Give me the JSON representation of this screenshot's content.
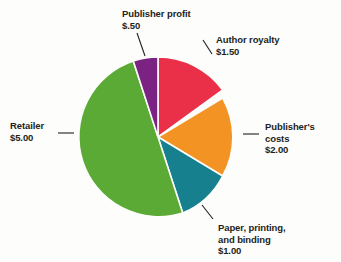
{
  "background_color": "#fdfdfb",
  "text_color": "#231f20",
  "leader_color": "#231f20",
  "chart_data": {
    "type": "pie",
    "title": "",
    "subtitle": "",
    "xlabel": "",
    "ylabel": "",
    "total": "10.00",
    "units": "dollars",
    "legend_position": "callout-labels",
    "grid": false,
    "start_angle_deg": 0,
    "direction": "clockwise",
    "categories": [
      "Author royalty",
      "Publisher's costs",
      "Paper, printing, and binding",
      "Retailer",
      "Publisher profit"
    ],
    "values": [
      1.5,
      2.0,
      1.0,
      5.0,
      0.5
    ],
    "value_labels": [
      "$1.50",
      "$2.00",
      "$1.00",
      "$5.00",
      "$.50"
    ],
    "colors": [
      "#ea2f49",
      "#f29323",
      "#16808f",
      "#5aaa35",
      "#7a2382"
    ],
    "slices": [
      {
        "name": "Author royalty",
        "value": 1.5,
        "value_label": "$1.50",
        "color": "#ea2f49",
        "start_deg": 0,
        "end_deg": 54
      },
      {
        "name": "Publisher's costs",
        "value": 2.0,
        "value_label": "$2.00",
        "color": "#f29323",
        "start_deg": 54,
        "end_deg": 126
      },
      {
        "name": "Paper, printing, and binding",
        "value": 1.0,
        "value_label": "$1.00",
        "color": "#16808f",
        "start_deg": 126,
        "end_deg": 162
      },
      {
        "name": "Retailer",
        "value": 5.0,
        "value_label": "$5.00",
        "color": "#5aaa35",
        "start_deg": 162,
        "end_deg": 342
      },
      {
        "name": "Publisher profit",
        "value": 0.5,
        "value_label": "$.50",
        "color": "#7a2382",
        "start_deg": 342,
        "end_deg": 360
      }
    ]
  },
  "labels": {
    "publisher_profit": {
      "name": "Publisher profit",
      "value": "$.50"
    },
    "author_royalty": {
      "name": "Author royalty",
      "value": "$1.50"
    },
    "publishers_costs": {
      "name_line1": "Publisher's",
      "name_line2": "costs",
      "value": "$2.00"
    },
    "retailer": {
      "name": "Retailer",
      "value": "$5.00"
    },
    "paper_printing": {
      "name_line1": "Paper, printing,",
      "name_line2": "and binding",
      "value": "$1.00"
    }
  }
}
